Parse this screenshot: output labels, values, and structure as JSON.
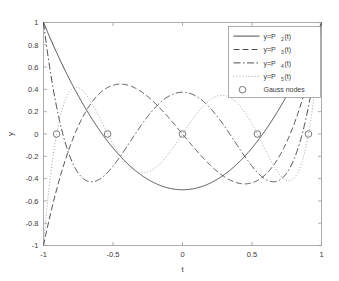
{
  "chart_data": {
    "type": "line",
    "title": "",
    "subtitle": "",
    "xlabel": "t",
    "ylabel": "y",
    "xlim": [
      -1,
      1
    ],
    "ylim": [
      -1,
      1
    ],
    "grid": false,
    "legend_position": "top-right",
    "xticks": [
      -1,
      -0.5,
      0,
      0.5,
      1
    ],
    "xticklabels": [
      "-1",
      "-0.5",
      "0",
      "0.5",
      "1"
    ],
    "yticks": [
      -1,
      -0.8,
      -0.6,
      -0.4,
      -0.2,
      0,
      0.2,
      0.4,
      0.6,
      0.8,
      1
    ],
    "yticklabels": [
      "-1",
      "-0.8",
      "-0.6",
      "-0.4",
      "-0.2",
      "0",
      "0.2",
      "0.4",
      "0.6",
      "0.8",
      "1"
    ],
    "series": [
      {
        "name": "y=P_2(t)",
        "legend_prefix": "y=P",
        "legend_subscript": "2",
        "legend_suffix": "(t)",
        "degree": 2,
        "style": "solid",
        "color": "#3a3a3a",
        "dasharray": "",
        "description": "Legendre polynomial P2(t) = (3t^2 - 1)/2",
        "x": [
          -1,
          -0.9,
          -0.8,
          -0.7,
          -0.6,
          -0.5,
          -0.4,
          -0.3,
          -0.2,
          -0.1,
          0,
          0.1,
          0.2,
          0.3,
          0.4,
          0.5,
          0.6,
          0.7,
          0.8,
          0.9,
          1
        ],
        "values": [
          1,
          0.715,
          0.46,
          0.235,
          0.04,
          -0.125,
          -0.26,
          -0.365,
          -0.44,
          -0.485,
          -0.5,
          -0.485,
          -0.44,
          -0.365,
          -0.26,
          -0.125,
          0.04,
          0.235,
          0.46,
          0.715,
          1
        ]
      },
      {
        "name": "y=P_3(t)",
        "legend_prefix": "y=P",
        "legend_subscript": "3",
        "legend_suffix": "(t)",
        "degree": 3,
        "style": "dashed",
        "color": "#3a3a3a",
        "dasharray": "6,3",
        "description": "Legendre polynomial P3(t) = (5t^3 - 3t)/2",
        "x": [
          -1,
          -0.9,
          -0.8,
          -0.7,
          -0.6,
          -0.5,
          -0.4,
          -0.3,
          -0.2,
          -0.1,
          0,
          0.1,
          0.2,
          0.3,
          0.4,
          0.5,
          0.6,
          0.7,
          0.8,
          0.9,
          1
        ],
        "values": [
          -1,
          -0.4725,
          -0.08,
          0.1925,
          0.36,
          0.4375,
          0.44,
          0.3825,
          0.28,
          0.1475,
          0,
          -0.1475,
          -0.28,
          -0.3825,
          -0.44,
          -0.4375,
          -0.36,
          -0.1925,
          0.08,
          0.4725,
          1
        ]
      },
      {
        "name": "y=P_4(t)",
        "legend_prefix": "y=P",
        "legend_subscript": "4",
        "legend_suffix": "(t)",
        "degree": 4,
        "style": "dashdot",
        "color": "#3a3a3a",
        "dasharray": "7,2.5,1.5,2.5",
        "description": "Legendre polynomial P4(t) = (35t^4 - 30t^2 + 3)/8",
        "x": [
          -1,
          -0.9,
          -0.8,
          -0.7,
          -0.6,
          -0.5,
          -0.4,
          -0.3,
          -0.2,
          -0.1,
          0,
          0.1,
          0.2,
          0.3,
          0.4,
          0.5,
          0.6,
          0.7,
          0.8,
          0.9,
          1
        ],
        "values": [
          1,
          0.0729,
          -0.233,
          -0.3652,
          -0.408,
          -0.4063,
          -0.3728,
          -0.3099,
          -0.212,
          -0.0729,
          0.375,
          -0.0729,
          -0.212,
          -0.3099,
          -0.3728,
          -0.4063,
          -0.408,
          -0.3652,
          -0.233,
          0.0729,
          1
        ]
      },
      {
        "name": "y=P_5(t)",
        "legend_prefix": "y=P",
        "legend_subscript": "5",
        "legend_suffix": "(t)",
        "degree": 5,
        "style": "dotted",
        "color": "#9a9a9a",
        "dasharray": "1,2",
        "description": "Legendre polynomial P5(t) = (63t^5 - 70t^3 + 15t)/8",
        "x": [
          -1,
          -0.9,
          -0.8,
          -0.7,
          -0.6,
          -0.5,
          -0.4,
          -0.3,
          -0.2,
          -0.1,
          0,
          0.1,
          0.2,
          0.3,
          0.4,
          0.5,
          0.6,
          0.7,
          0.8,
          0.9,
          1
        ],
        "values": [
          -1,
          -0.2988,
          0.3995,
          0.3652,
          0.1526,
          -0.0898,
          -0.2706,
          -0.3397,
          -0.2723,
          -0.1187,
          0,
          0.1187,
          0.2723,
          0.3397,
          0.2706,
          0.0898,
          -0.1526,
          -0.3652,
          -0.3995,
          0.2988,
          1
        ]
      }
    ],
    "markers": {
      "name": "Gauss nodes",
      "marker": "circle-open",
      "color": "#6a6a6a",
      "description": "5-point Gauss-Legendre nodes (roots of P5)",
      "x": [
        -0.9061798,
        -0.5384693,
        0,
        0.5384693,
        0.9061798
      ],
      "y": [
        0,
        0,
        0,
        0,
        0
      ]
    },
    "legend_entries": [
      "y=P_2(t)",
      "y=P_3(t)",
      "y=P_4(t)",
      "y=P_5(t)",
      "Gauss nodes"
    ]
  },
  "legend": {
    "marker_label": "Gauss nodes",
    "marker_glyph": "O"
  },
  "axes": {
    "xlabel": "t",
    "ylabel": "y"
  }
}
